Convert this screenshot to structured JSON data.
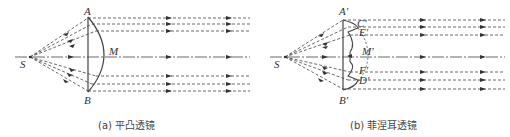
{
  "figure": {
    "panels": [
      {
        "id": "a",
        "caption": "(a) 平凸透镜",
        "labels": {
          "source": "S",
          "top": "A",
          "bottom": "B",
          "vertex": "M"
        }
      },
      {
        "id": "b",
        "caption": "(b) 菲涅耳透镜",
        "labels": {
          "source": "S",
          "top": "A'",
          "bottom": "B'",
          "c": "C'",
          "e": "E'",
          "m": "M'",
          "f": "F'",
          "d": "D'"
        }
      }
    ],
    "colors": {
      "line": "#333333",
      "background": "#ffffff"
    }
  }
}
